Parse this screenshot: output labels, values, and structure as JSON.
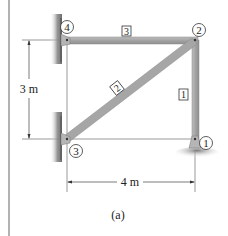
{
  "figure": {
    "caption": "(a)",
    "structure": "truss",
    "dimensions": {
      "height_label": "3 m",
      "width_label": "4 m"
    },
    "nodes": [
      {
        "id": "1",
        "label": "1",
        "x": 195,
        "y": 139,
        "support": "pin-ground"
      },
      {
        "id": "2",
        "label": "2",
        "x": 195,
        "y": 40,
        "support": "none"
      },
      {
        "id": "3",
        "label": "3",
        "x": 67,
        "y": 139,
        "support": "pin-wall"
      },
      {
        "id": "4",
        "label": "4",
        "x": 67,
        "y": 40,
        "support": "pin-wall"
      }
    ],
    "members": [
      {
        "id": "1",
        "label": "1",
        "from": "1",
        "to": "2"
      },
      {
        "id": "2",
        "label": "2",
        "from": "3",
        "to": "2"
      },
      {
        "id": "3",
        "label": "3",
        "from": "4",
        "to": "2"
      }
    ],
    "colors": {
      "member_fill": "#a9a9a9",
      "member_edge": "#8a8a8a",
      "line": "#444444",
      "wall_shadow": "#9a9a9a"
    }
  }
}
